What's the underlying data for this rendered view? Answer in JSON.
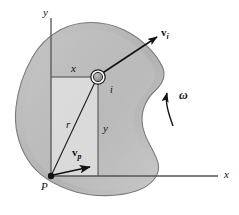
{
  "figure": {
    "labels": {
      "axis_y": "y",
      "axis_x": "x",
      "component_x": "x",
      "component_y": "y",
      "radius": "r",
      "particle": "i",
      "point_p": "P",
      "velocity_i": "v",
      "velocity_i_sub": "i",
      "velocity_p": "v",
      "velocity_p_sub": "p",
      "omega": "ω"
    },
    "colors": {
      "body_fill_dark": "#b0b0b0",
      "body_fill_light": "#d8d8d8",
      "body_inner_light": "#eaeaea",
      "body_outline": "#6a6a6a",
      "line": "#1a1a1a",
      "axis": "#555555",
      "background": "#ffffff",
      "particle_fill": "#9a9a9a",
      "particle_ring": "#222222"
    },
    "geometry": {
      "point_p": [
        51,
        176
      ],
      "particle_i": [
        98,
        77
      ],
      "velocity_i_tip": [
        158,
        36
      ],
      "velocity_p_tip": [
        93,
        168
      ],
      "x_axis_end": [
        218,
        176
      ],
      "y_axis_top": [
        51,
        18
      ]
    }
  }
}
